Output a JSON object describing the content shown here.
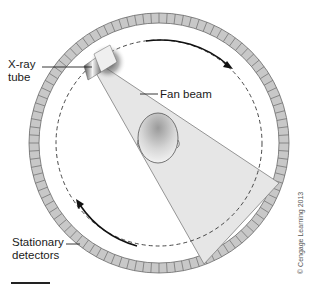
{
  "labels": {
    "xray_tube": "X-ray\ntube",
    "fan_beam": "Fan beam",
    "stationary_detectors": "Stationary\ndetectors",
    "copyright": "© Cengage Learning 2013"
  },
  "colors": {
    "detector_fill": "#c8c8c8",
    "detector_stroke": "#6a6a6a",
    "beam_fill": "#e6e6e6",
    "beam_stroke": "#8a8a8a",
    "dashed_orbit": "#333333",
    "arrow": "#111111"
  },
  "geometry": {
    "center": [
      159,
      143
    ],
    "detector_ring_outer_radius": 130,
    "detector_ring_inner_radius": 120,
    "orbit_radius": 103,
    "detector_count": 100
  }
}
